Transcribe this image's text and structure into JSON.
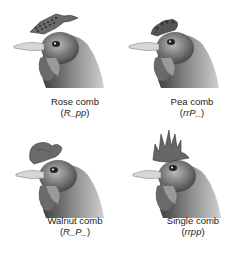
{
  "figure": {
    "panels": [
      {
        "id": "rose",
        "name": "Rose comb",
        "genotype": "R_pp",
        "comb_shape": "rose",
        "position": "top-left"
      },
      {
        "id": "pea",
        "name": "Pea comb",
        "genotype": "rrP_",
        "comb_shape": "pea",
        "position": "top-right"
      },
      {
        "id": "walnut",
        "name": "Walnut comb",
        "genotype": "R_P_",
        "comb_shape": "walnut",
        "position": "bottom-left"
      },
      {
        "id": "single",
        "name": "Single comb",
        "genotype": "rrpp",
        "comb_shape": "single",
        "position": "bottom-right"
      }
    ]
  }
}
